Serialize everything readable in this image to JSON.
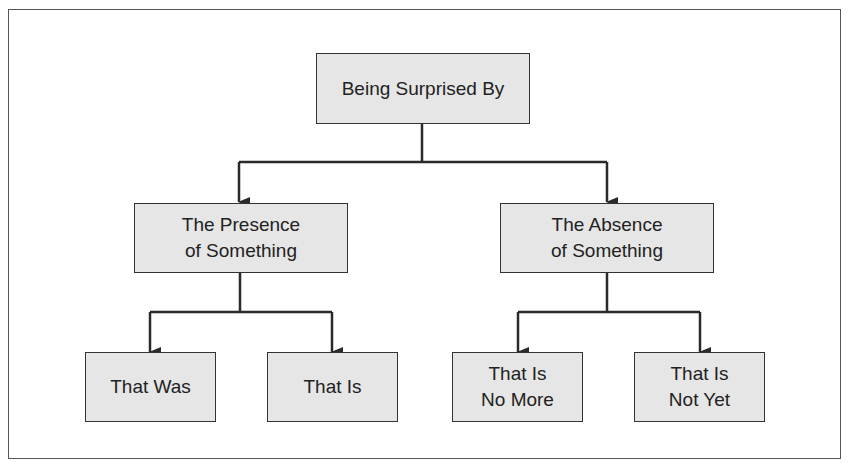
{
  "diagram": {
    "type": "tree",
    "root": {
      "label": "Being Surprised By",
      "children": [
        {
          "label": "The Presence\nof Something",
          "children": [
            {
              "label": "That Was"
            },
            {
              "label": "That Is"
            }
          ]
        },
        {
          "label": "The Absence\nof Something",
          "children": [
            {
              "label": "That Is\nNo More"
            },
            {
              "label": "That Is\nNot Yet"
            }
          ]
        }
      ]
    },
    "colors": {
      "box_fill": "#e6e6e6",
      "box_border": "#333333",
      "line": "#2a2a2a",
      "frame": "#555555"
    }
  }
}
